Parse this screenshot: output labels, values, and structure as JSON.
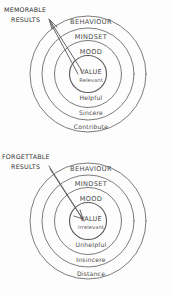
{
  "canvas": {
    "width": 171,
    "height": 295,
    "background": "#fdfdfd",
    "ink": "#4a4a4a"
  },
  "diagrams": [
    {
      "id": "memorable",
      "callout": {
        "line1": "MEMORABLE",
        "line2": "RESULTS"
      },
      "rings_outer_to_inner": [
        "BEHAVIOUR",
        "MINDSET",
        "MOOD"
      ],
      "core": {
        "main": "VALUE",
        "sub": "Relevant"
      },
      "rings_inner_to_outer_lower": [
        "Helpful",
        "Sincere",
        "Contribute"
      ]
    },
    {
      "id": "forgettable",
      "callout": {
        "line1": "FORGETTABLE",
        "line2": "RESULTS"
      },
      "rings_outer_to_inner": [
        "BEHAVIOUR",
        "MINDSET",
        "MOOD"
      ],
      "core": {
        "main": "VALUE",
        "sub": "Irrelevant"
      },
      "rings_inner_to_outer_lower": [
        "Unhelpful",
        "Insincere",
        "Distance"
      ]
    }
  ]
}
